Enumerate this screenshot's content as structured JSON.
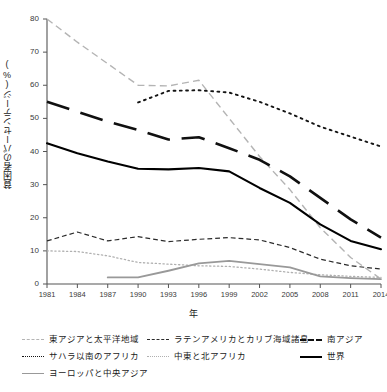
{
  "chart_data": {
    "type": "line",
    "title": "",
    "xlabel": "年",
    "ylabel": "貧困者のパーセンテージ(%)",
    "x": [
      1981,
      1984,
      1987,
      1990,
      1993,
      1996,
      1999,
      2002,
      2005,
      2008,
      2011,
      2014
    ],
    "xticklabels": [
      "1981",
      "1984",
      "1987",
      "1990",
      "1993",
      "1996",
      "1999",
      "2002",
      "2005",
      "2008",
      "2011",
      "2014"
    ],
    "yticklabels": [
      "0",
      "10",
      "20",
      "30",
      "40",
      "50",
      "60",
      "70",
      "80"
    ],
    "xlim": [
      1981,
      2014
    ],
    "ylim": [
      0,
      80
    ],
    "ytick_step": 10,
    "grid": false,
    "legend_position": "below",
    "series": [
      {
        "name": "東アジアと太平洋地域",
        "style": "dashed",
        "color": "#b4b4b4",
        "width": 1.4,
        "dash": "5,3",
        "x": [
          1981,
          1984,
          1987,
          1990,
          1993,
          1996,
          1999,
          2002,
          2005,
          2008,
          2011,
          2014
        ],
        "values": [
          80.0,
          73.0,
          66.5,
          60.0,
          59.8,
          61.5,
          50.0,
          38.5,
          28.5,
          17.0,
          8.0,
          1.5
        ]
      },
      {
        "name": "ラテンアメリカとカリブ海域諸島",
        "style": "dashed-thin",
        "color": "#2b2b2b",
        "width": 1.2,
        "dash": "4,2.5",
        "x": [
          1981,
          1984,
          1987,
          1990,
          1993,
          1996,
          1999,
          2002,
          2005,
          2008,
          2011,
          2014
        ],
        "values": [
          13.0,
          15.7,
          13.0,
          14.3,
          12.8,
          13.5,
          14.0,
          13.3,
          11.0,
          7.5,
          5.5,
          4.5
        ]
      },
      {
        "name": "南アジア",
        "style": "dashed-bold",
        "color": "#101010",
        "width": 2.6,
        "dash": "9,4.5",
        "x": [
          1981,
          1984,
          1987,
          1990,
          1993,
          1996,
          1999,
          2002,
          2005,
          2008,
          2011,
          2014
        ],
        "values": [
          55.0,
          52.0,
          49.0,
          46.5,
          43.6,
          44.3,
          41.0,
          37.5,
          32.5,
          26.0,
          19.5,
          14.0
        ]
      },
      {
        "name": "サハラ以南のアフリカ",
        "style": "dotted",
        "color": "#141414",
        "width": 1.9,
        "dash": "1,2.3",
        "x": [
          1990,
          1993,
          1996,
          1999,
          2002,
          2005,
          2008,
          2011,
          2014
        ],
        "values": [
          54.8,
          58.3,
          58.5,
          57.8,
          55.0,
          51.5,
          47.5,
          44.5,
          41.5
        ]
      },
      {
        "name": "中東と北アフリカ",
        "style": "dotted-light",
        "color": "#b0b0b0",
        "width": 1.3,
        "dash": "1,2",
        "x": [
          1981,
          1984,
          1987,
          1990,
          1993,
          1996,
          1999,
          2002,
          2005,
          2008,
          2011,
          2014
        ],
        "values": [
          10.0,
          9.8,
          8.5,
          6.5,
          6.0,
          5.5,
          5.3,
          4.5,
          3.5,
          2.8,
          2.3,
          2.0
        ]
      },
      {
        "name": "世界",
        "style": "solid-bold",
        "color": "#000000",
        "width": 2.1,
        "dash": "none",
        "x": [
          1981,
          1984,
          1987,
          1990,
          1993,
          1996,
          1999,
          2002,
          2005,
          2008,
          2011,
          2014
        ],
        "values": [
          42.5,
          39.5,
          37.0,
          34.8,
          34.6,
          35.0,
          34.0,
          29.0,
          24.5,
          18.0,
          13.0,
          10.5
        ]
      },
      {
        "name": "ヨーロッパと中央アジア",
        "style": "solid-gray",
        "color": "#999999",
        "width": 1.8,
        "dash": "none",
        "x": [
          1987,
          1990,
          1993,
          1996,
          1999,
          2002,
          2005,
          2008,
          2011,
          2014
        ],
        "values": [
          2.0,
          2.0,
          4.0,
          6.2,
          7.0,
          6.0,
          5.0,
          2.3,
          1.8,
          1.5
        ]
      }
    ]
  },
  "legend": {
    "items": [
      {
        "label": "東アジアと太平洋地域",
        "style": "dashed",
        "color": "#b4b4b4"
      },
      {
        "label": "ラテンアメリカとカリブ海域諸島",
        "style": "dashed-thin",
        "color": "#2b2b2b"
      },
      {
        "label": "南アジア",
        "style": "dashed-bold",
        "color": "#101010"
      },
      {
        "label": "サハラ以南のアフリカ",
        "style": "dotted",
        "color": "#141414"
      },
      {
        "label": "中東と北アフリカ",
        "style": "dotted-light",
        "color": "#b0b0b0"
      },
      {
        "label": "世界",
        "style": "solid-bold",
        "color": "#000000"
      },
      {
        "label": "ヨーロッパと中央アジア",
        "style": "solid-gray",
        "color": "#999999"
      }
    ]
  }
}
